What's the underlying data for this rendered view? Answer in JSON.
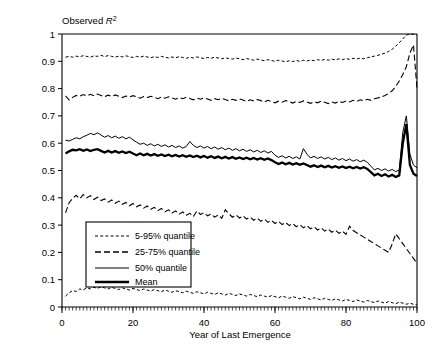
{
  "chart_data": {
    "type": "line",
    "title": "",
    "ylabel": "Observed R²",
    "ylabel_parts": {
      "text": "Observed ",
      "italic": "R",
      "sup": "2"
    },
    "xlabel": "Year of Last Emergence",
    "xlim": [
      0,
      100
    ],
    "ylim": [
      0,
      1
    ],
    "xticks": [
      0,
      20,
      40,
      60,
      80,
      100
    ],
    "yticks": [
      0,
      0.1,
      0.2,
      0.3,
      0.4,
      0.5,
      0.6,
      0.7,
      0.8,
      0.9,
      1
    ],
    "xtick_labels": [
      "0",
      "20",
      "40",
      "60",
      "80",
      "100"
    ],
    "ytick_labels": [
      "0",
      "0.1",
      "0.2",
      "0.3",
      "0.4",
      "0.5",
      "0.6",
      "0.7",
      "0.8",
      "0.9",
      "1"
    ],
    "minor_ticks_x": true,
    "grid": false,
    "legend_position": "lower-left-inside",
    "line_color": "#000000",
    "x": [
      1,
      2,
      3,
      4,
      5,
      6,
      7,
      8,
      9,
      10,
      11,
      12,
      13,
      14,
      15,
      16,
      17,
      18,
      19,
      20,
      21,
      22,
      23,
      24,
      25,
      26,
      27,
      28,
      29,
      30,
      31,
      32,
      33,
      34,
      35,
      36,
      37,
      38,
      39,
      40,
      41,
      42,
      43,
      44,
      45,
      46,
      47,
      48,
      49,
      50,
      51,
      52,
      53,
      54,
      55,
      56,
      57,
      58,
      59,
      60,
      61,
      62,
      63,
      64,
      65,
      66,
      67,
      68,
      69,
      70,
      71,
      72,
      73,
      74,
      75,
      76,
      77,
      78,
      79,
      80,
      81,
      82,
      83,
      84,
      85,
      86,
      87,
      88,
      89,
      90,
      91,
      92,
      93,
      94,
      95,
      96,
      97,
      98,
      99,
      100
    ],
    "series": [
      {
        "name": "5-95% quantile",
        "style": "dotted",
        "label": "5-95% quantile",
        "upper_name": "95% quantile",
        "lower_name": "5% quantile",
        "upper": [
          0.915,
          0.918,
          0.915,
          0.919,
          0.916,
          0.921,
          0.918,
          0.915,
          0.92,
          0.918,
          0.922,
          0.917,
          0.921,
          0.918,
          0.915,
          0.919,
          0.916,
          0.92,
          0.917,
          0.914,
          0.918,
          0.915,
          0.919,
          0.916,
          0.913,
          0.917,
          0.914,
          0.918,
          0.915,
          0.912,
          0.916,
          0.913,
          0.917,
          0.914,
          0.911,
          0.915,
          0.912,
          0.916,
          0.913,
          0.91,
          0.914,
          0.911,
          0.915,
          0.912,
          0.909,
          0.913,
          0.91,
          0.908,
          0.912,
          0.909,
          0.906,
          0.91,
          0.907,
          0.904,
          0.908,
          0.905,
          0.902,
          0.906,
          0.903,
          0.9,
          0.904,
          0.901,
          0.898,
          0.902,
          0.899,
          0.903,
          0.9,
          0.904,
          0.901,
          0.905,
          0.902,
          0.906,
          0.903,
          0.907,
          0.904,
          0.908,
          0.905,
          0.909,
          0.906,
          0.91,
          0.907,
          0.911,
          0.908,
          0.912,
          0.909,
          0.913,
          0.916,
          0.919,
          0.922,
          0.926,
          0.93,
          0.936,
          0.944,
          0.955,
          0.968,
          0.982,
          0.996,
          1.0,
          0.999,
          0.998
        ],
        "lower": [
          0.04,
          0.052,
          0.06,
          0.057,
          0.066,
          0.063,
          0.07,
          0.066,
          0.072,
          0.068,
          0.074,
          0.07,
          0.066,
          0.072,
          0.068,
          0.064,
          0.07,
          0.066,
          0.062,
          0.068,
          0.064,
          0.06,
          0.066,
          0.062,
          0.058,
          0.064,
          0.06,
          0.056,
          0.062,
          0.058,
          0.054,
          0.06,
          0.056,
          0.052,
          0.058,
          0.054,
          0.05,
          0.056,
          0.052,
          0.048,
          0.054,
          0.05,
          0.046,
          0.052,
          0.048,
          0.044,
          0.05,
          0.046,
          0.042,
          0.048,
          0.044,
          0.04,
          0.046,
          0.042,
          0.038,
          0.044,
          0.04,
          0.036,
          0.042,
          0.038,
          0.034,
          0.04,
          0.036,
          0.032,
          0.038,
          0.034,
          0.03,
          0.036,
          0.032,
          0.028,
          0.034,
          0.03,
          0.026,
          0.032,
          0.028,
          0.024,
          0.03,
          0.026,
          0.022,
          0.028,
          0.024,
          0.02,
          0.026,
          0.022,
          0.018,
          0.024,
          0.02,
          0.016,
          0.022,
          0.018,
          0.014,
          0.02,
          0.016,
          0.012,
          0.018,
          0.014,
          0.01,
          0.014,
          0.01,
          0.008
        ]
      },
      {
        "name": "25-75% quantile",
        "style": "dashed",
        "label": "25-75% quantile",
        "upper_name": "75% quantile",
        "lower_name": "25% quantile",
        "upper": [
          0.773,
          0.758,
          0.768,
          0.775,
          0.772,
          0.778,
          0.773,
          0.779,
          0.774,
          0.78,
          0.775,
          0.77,
          0.776,
          0.771,
          0.777,
          0.772,
          0.767,
          0.773,
          0.769,
          0.774,
          0.77,
          0.765,
          0.771,
          0.767,
          0.772,
          0.768,
          0.763,
          0.769,
          0.765,
          0.77,
          0.766,
          0.761,
          0.767,
          0.763,
          0.768,
          0.764,
          0.759,
          0.765,
          0.761,
          0.766,
          0.762,
          0.757,
          0.763,
          0.759,
          0.764,
          0.76,
          0.755,
          0.761,
          0.757,
          0.762,
          0.758,
          0.753,
          0.759,
          0.755,
          0.76,
          0.756,
          0.751,
          0.757,
          0.753,
          0.748,
          0.754,
          0.75,
          0.756,
          0.752,
          0.747,
          0.753,
          0.749,
          0.755,
          0.751,
          0.746,
          0.752,
          0.748,
          0.754,
          0.75,
          0.745,
          0.751,
          0.747,
          0.753,
          0.749,
          0.755,
          0.751,
          0.757,
          0.753,
          0.759,
          0.755,
          0.761,
          0.757,
          0.763,
          0.766,
          0.77,
          0.775,
          0.782,
          0.792,
          0.808,
          0.828,
          0.852,
          0.88,
          0.93,
          0.96,
          0.8
        ],
        "lower": [
          0.345,
          0.382,
          0.398,
          0.409,
          0.396,
          0.412,
          0.4,
          0.408,
          0.394,
          0.402,
          0.39,
          0.396,
          0.384,
          0.392,
          0.38,
          0.388,
          0.376,
          0.383,
          0.371,
          0.379,
          0.367,
          0.374,
          0.362,
          0.37,
          0.358,
          0.365,
          0.353,
          0.361,
          0.349,
          0.356,
          0.344,
          0.352,
          0.34,
          0.348,
          0.336,
          0.343,
          0.331,
          0.352,
          0.339,
          0.346,
          0.334,
          0.341,
          0.329,
          0.337,
          0.325,
          0.356,
          0.342,
          0.329,
          0.338,
          0.326,
          0.334,
          0.322,
          0.33,
          0.318,
          0.326,
          0.314,
          0.322,
          0.31,
          0.318,
          0.306,
          0.314,
          0.302,
          0.31,
          0.298,
          0.306,
          0.294,
          0.302,
          0.29,
          0.298,
          0.286,
          0.294,
          0.282,
          0.29,
          0.278,
          0.286,
          0.274,
          0.282,
          0.27,
          0.278,
          0.266,
          0.296,
          0.28,
          0.272,
          0.264,
          0.256,
          0.248,
          0.24,
          0.232,
          0.224,
          0.216,
          0.208,
          0.2,
          0.23,
          0.268,
          0.25,
          0.232,
          0.214,
          0.196,
          0.178,
          0.16
        ]
      },
      {
        "name": "50% quantile",
        "style": "solid-thin",
        "label": "50% quantile",
        "values": [
          0.611,
          0.608,
          0.614,
          0.62,
          0.616,
          0.624,
          0.629,
          0.636,
          0.631,
          0.638,
          0.63,
          0.622,
          0.628,
          0.62,
          0.626,
          0.618,
          0.624,
          0.616,
          0.622,
          0.612,
          0.604,
          0.596,
          0.6,
          0.592,
          0.598,
          0.59,
          0.596,
          0.588,
          0.594,
          0.586,
          0.592,
          0.584,
          0.59,
          0.582,
          0.588,
          0.606,
          0.592,
          0.584,
          0.59,
          0.582,
          0.588,
          0.58,
          0.586,
          0.578,
          0.584,
          0.576,
          0.582,
          0.574,
          0.58,
          0.572,
          0.578,
          0.57,
          0.576,
          0.568,
          0.574,
          0.566,
          0.572,
          0.564,
          0.57,
          0.556,
          0.548,
          0.554,
          0.546,
          0.552,
          0.544,
          0.55,
          0.542,
          0.58,
          0.56,
          0.546,
          0.552,
          0.544,
          0.55,
          0.542,
          0.548,
          0.54,
          0.546,
          0.538,
          0.544,
          0.536,
          0.542,
          0.534,
          0.54,
          0.532,
          0.538,
          0.53,
          0.516,
          0.502,
          0.508,
          0.5,
          0.506,
          0.498,
          0.504,
          0.496,
          0.502,
          0.64,
          0.7,
          0.56,
          0.52,
          0.51
        ]
      },
      {
        "name": "Mean",
        "style": "solid-thick",
        "label": "Mean",
        "values": [
          0.562,
          0.57,
          0.576,
          0.574,
          0.578,
          0.572,
          0.577,
          0.571,
          0.576,
          0.578,
          0.572,
          0.566,
          0.572,
          0.566,
          0.571,
          0.565,
          0.57,
          0.564,
          0.569,
          0.562,
          0.556,
          0.562,
          0.556,
          0.561,
          0.555,
          0.56,
          0.554,
          0.559,
          0.553,
          0.558,
          0.552,
          0.557,
          0.551,
          0.556,
          0.55,
          0.555,
          0.549,
          0.554,
          0.548,
          0.553,
          0.547,
          0.552,
          0.546,
          0.551,
          0.545,
          0.55,
          0.544,
          0.549,
          0.543,
          0.548,
          0.542,
          0.547,
          0.541,
          0.546,
          0.54,
          0.545,
          0.539,
          0.544,
          0.538,
          0.53,
          0.524,
          0.529,
          0.523,
          0.528,
          0.522,
          0.527,
          0.521,
          0.526,
          0.52,
          0.514,
          0.519,
          0.513,
          0.518,
          0.512,
          0.517,
          0.511,
          0.516,
          0.51,
          0.515,
          0.509,
          0.514,
          0.508,
          0.513,
          0.507,
          0.512,
          0.506,
          0.494,
          0.482,
          0.488,
          0.48,
          0.486,
          0.478,
          0.484,
          0.476,
          0.482,
          0.6,
          0.67,
          0.52,
          0.488,
          0.48
        ]
      }
    ]
  },
  "legend": {
    "items": [
      {
        "label": "5-95% quantile",
        "style": "dotted"
      },
      {
        "label": "25-75% quantile",
        "style": "dashed"
      },
      {
        "label": "50% quantile",
        "style": "solid-thin"
      },
      {
        "label": "Mean",
        "style": "solid-thick"
      }
    ]
  }
}
